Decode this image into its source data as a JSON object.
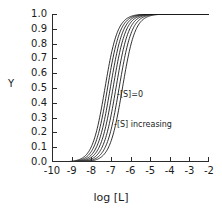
{
  "chart_data": {
    "type": "line",
    "title": "",
    "xlabel": "log [L]",
    "ylabel": "Y",
    "xlim": [
      -10,
      -2
    ],
    "ylim": [
      0.0,
      1.0
    ],
    "grid": false,
    "legend": "none",
    "xticks": [
      -10,
      -9,
      -8,
      -7,
      -6,
      -5,
      -4,
      -3,
      -2
    ],
    "xticklabels": [
      "-10",
      "-9",
      "-8",
      "-7",
      "-6",
      "-5",
      "-4",
      "-3",
      "-2"
    ],
    "yticks": [
      0.0,
      0.1,
      0.2,
      0.3,
      0.4,
      0.5,
      0.6,
      0.7,
      0.8,
      0.9,
      1.0
    ],
    "yticklabels": [
      "0.0",
      "0.1",
      "0.2",
      "0.3",
      "0.4",
      "0.5",
      "0.6",
      "0.7",
      "0.8",
      "0.9",
      "1.0"
    ],
    "annotations": [
      {
        "text": "-[S]=0",
        "x": -5.9,
        "y": 0.49
      },
      {
        "text": "-[S] increasing",
        "x": -6.0,
        "y": 0.28
      }
    ],
    "curve_model": "Y = 1 / (1 + 10^(n*(logEC50 - x)))",
    "hill_slope": 1.35,
    "series": [
      {
        "name": "[S]=0",
        "logEC50": -7.3,
        "color": "#1a1a1a"
      },
      {
        "name": "[S] step 1",
        "logEC50": -7.17,
        "color": "#1a1a1a"
      },
      {
        "name": "[S] step 2",
        "logEC50": -7.03,
        "color": "#1a1a1a"
      },
      {
        "name": "[S] step 3",
        "logEC50": -6.89,
        "color": "#1a1a1a"
      },
      {
        "name": "[S] step 4",
        "logEC50": -6.74,
        "color": "#1a1a1a"
      },
      {
        "name": "[S] step 5",
        "logEC50": -6.58,
        "color": "#1a1a1a"
      },
      {
        "name": "[S] step 6",
        "logEC50": -6.41,
        "color": "#1a1a1a"
      }
    ],
    "x_samples": [
      -10,
      -9.5,
      -9,
      -8.75,
      -8.5,
      -8.25,
      -8,
      -7.75,
      -7.5,
      -7.25,
      -7,
      -6.75,
      -6.5,
      -6.25,
      -6,
      -5.75,
      -5.5,
      -5.25,
      -5,
      -4.5,
      -4,
      -3.5,
      -3,
      -2.5,
      -2
    ],
    "axis_color": "#2b2b2b",
    "background": "#ffffff"
  }
}
